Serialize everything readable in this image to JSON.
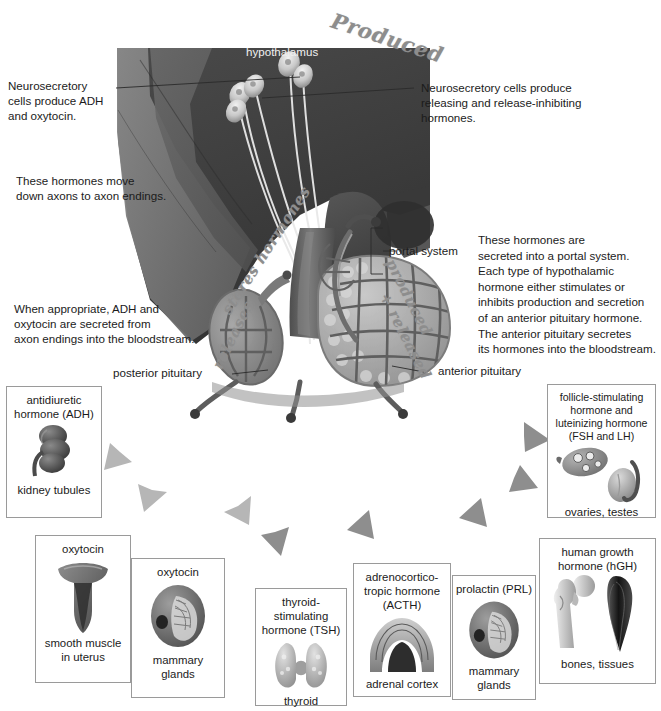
{
  "diagram": {
    "palette": {
      "brain_dark": "#3f3f3f",
      "brain_mid": "#5a5a5a",
      "brain_light": "#7b7b7b",
      "stalk": "#6a6a6a",
      "posterior_lobe": "#8a8a8a",
      "anterior_lobe": "#a9a9a9",
      "vessel": "#6d6d6d",
      "arrow_light": "#b4b4b4",
      "arrow_dark": "#8c8c8c",
      "box_border": "#9a9a9a",
      "text": "#1b1b1b",
      "handwriting": "#8d8d8d",
      "background": "#ffffff"
    },
    "anatomy_labels": {
      "hypothalamus": "hypothalamus",
      "portal_system": "portal system",
      "posterior_pituitary": "posterior pituitary",
      "anterior_pituitary": "anterior pituitary"
    },
    "annotations": [
      {
        "id": "neurosecretory-adh",
        "text": "Neurosecretory\ncells produce ADH\nand oxytocin."
      },
      {
        "id": "hormones-move-axons",
        "text": "These hormones move\ndown axons to axon endings."
      },
      {
        "id": "adh-oxytocin-secreted",
        "text": "When appropriate, ADH and\noxytocin are secreted from\naxon endings into the bloodstream."
      },
      {
        "id": "neurosecretory-releasing",
        "text": "Neurosecretory cells produce\nreleasing and release-inhibiting\nhormones."
      },
      {
        "id": "portal-secretion",
        "text": "These hormones are\nsecreted into a portal system.\nEach type of hypothalamic\nhormone either stimulates or\ninhibits production and secretion\nof an anterior pituitary hormone.\nThe anterior pituitary secretes\nits hormones into the bloodstream."
      }
    ],
    "handwritten_notes": [
      {
        "id": "produced-top",
        "text": "Produced"
      },
      {
        "id": "stores-hormones",
        "text": "stores hormones"
      },
      {
        "id": "releases",
        "text": "releases"
      },
      {
        "id": "produced-released",
        "text": "produced"
      },
      {
        "id": "plus-released",
        "text": "+ released"
      }
    ],
    "target_boxes": [
      {
        "id": "adh",
        "hormone": "antidiuretic\nhormone (ADH)",
        "target": "kidney tubules",
        "icon": "kidney-icon",
        "source": "posterior"
      },
      {
        "id": "oxytocin-uterus",
        "hormone": "oxytocin",
        "target": "smooth muscle\nin uterus",
        "icon": "uterus-icon",
        "source": "posterior"
      },
      {
        "id": "oxytocin-mammary",
        "hormone": "oxytocin",
        "target": "mammary\nglands",
        "icon": "breast-icon",
        "source": "posterior"
      },
      {
        "id": "tsh",
        "hormone": "thyroid-\nstimulating\nhormone (TSH)",
        "target": "thyroid",
        "icon": "thyroid-icon",
        "source": "anterior"
      },
      {
        "id": "acth",
        "hormone": "adrenocortico-\ntropic hormone\n(ACTH)",
        "target": "adrenal cortex",
        "icon": "adrenal-cortex-icon",
        "source": "anterior"
      },
      {
        "id": "prl",
        "hormone": "prolactin (PRL)",
        "target": "mammary\nglands",
        "icon": "breast-icon",
        "source": "anterior"
      },
      {
        "id": "hgh",
        "hormone": "human growth\nhormone (hGH)",
        "target": "bones, tissues",
        "icon": "bone-muscle-icon",
        "source": "anterior"
      },
      {
        "id": "fsh-lh",
        "hormone": "follicle-stimulating\nhormone and\nluteinizing hormone\n(FSH and LH)",
        "target": "ovaries, testes",
        "icon": "ovary-testis-icon",
        "source": "anterior"
      }
    ]
  }
}
